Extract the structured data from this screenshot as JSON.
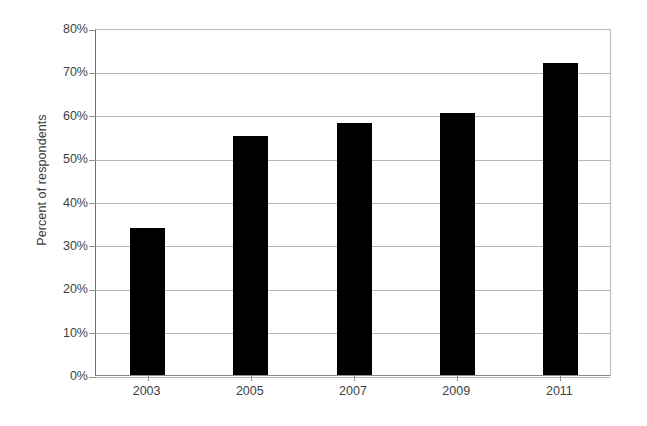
{
  "chart_data": {
    "type": "bar",
    "title": "",
    "subtitle": "",
    "xlabel": "",
    "ylabel": "Percent of respondents",
    "categories": [
      "2003",
      "2005",
      "2007",
      "2009",
      "2011"
    ],
    "values": [
      34,
      55,
      58,
      60.5,
      72
    ],
    "value_labels": [
      "",
      "",
      "",
      "",
      ""
    ],
    "ylim": [
      0,
      80
    ],
    "ytick_values": [
      0,
      10,
      20,
      30,
      40,
      50,
      60,
      70,
      80
    ],
    "ytick_labels": [
      "0%",
      "10%",
      "20%",
      "30%",
      "40%",
      "50%",
      "60%",
      "70%",
      "80%"
    ],
    "series": [
      {
        "name": "",
        "values": [
          34,
          55,
          58,
          60.5,
          72
        ],
        "color": "#000000"
      }
    ],
    "grid": true,
    "grid_axis": "y",
    "legend": false,
    "legend_position": "none",
    "bar_color": "#000000",
    "gridline_color": "#b5b5b5",
    "axis_color": "#6d6d6d",
    "text_color": "#3f3f3f",
    "background_color": "#ffffff",
    "annotations": []
  },
  "figure": {
    "y_axis_title": "Percent of respondents"
  }
}
